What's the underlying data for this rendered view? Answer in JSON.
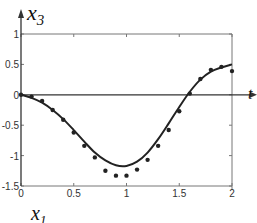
{
  "chart_data": {
    "type": "line",
    "title": "",
    "xlabel": "t",
    "ylabel": "x3",
    "bottom_label": "x1",
    "xlim": [
      0,
      2
    ],
    "ylim": [
      -1.5,
      1
    ],
    "x_ticks": [
      "0",
      "0.5",
      "1",
      "1.5",
      "2"
    ],
    "y_ticks": [
      "1",
      "0.5",
      "0",
      "-0.5",
      "-1",
      "-1.5"
    ],
    "grid": false,
    "series": [
      {
        "name": "model",
        "style": "solid-line",
        "x": [
          0,
          0.1,
          0.2,
          0.3,
          0.4,
          0.5,
          0.6,
          0.7,
          0.8,
          0.9,
          1.0,
          1.1,
          1.2,
          1.3,
          1.4,
          1.5,
          1.6,
          1.7,
          1.8,
          1.9,
          2.0
        ],
        "values": [
          0,
          -0.05,
          -0.13,
          -0.25,
          -0.4,
          -0.58,
          -0.77,
          -0.95,
          -1.08,
          -1.16,
          -1.17,
          -1.1,
          -0.95,
          -0.73,
          -0.47,
          -0.2,
          0.05,
          0.25,
          0.38,
          0.45,
          0.5
        ]
      },
      {
        "name": "data",
        "style": "markers",
        "x": [
          0,
          0.1,
          0.2,
          0.3,
          0.4,
          0.5,
          0.6,
          0.7,
          0.8,
          0.9,
          1.0,
          1.1,
          1.2,
          1.3,
          1.4,
          1.5,
          1.6,
          1.7,
          1.8,
          1.9,
          2.0
        ],
        "values": [
          0,
          -0.03,
          -0.1,
          -0.25,
          -0.41,
          -0.62,
          -0.84,
          -1.03,
          -1.25,
          -1.33,
          -1.33,
          -1.23,
          -1.07,
          -0.84,
          -0.58,
          -0.27,
          0.02,
          0.26,
          0.41,
          0.46,
          0.39
        ]
      }
    ]
  },
  "labels": {
    "y_axis": "x",
    "y_axis_sub": "3",
    "x_axis": "t",
    "bottom": "x",
    "bottom_sub": "1"
  },
  "colors": {
    "line": "#222222",
    "markers": "#222222",
    "axes": "#333333",
    "frame": "#777777"
  }
}
